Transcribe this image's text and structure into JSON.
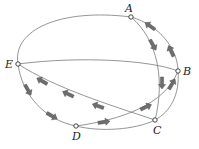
{
  "diagram": {
    "type": "directed-graph-tour",
    "nodes": [
      {
        "id": "A",
        "label": "A"
      },
      {
        "id": "B",
        "label": "B"
      },
      {
        "id": "C",
        "label": "C"
      },
      {
        "id": "D",
        "label": "D"
      },
      {
        "id": "E",
        "label": "E"
      }
    ],
    "edges": [
      {
        "from": "A",
        "to": "E",
        "directed": false
      },
      {
        "from": "E",
        "to": "B",
        "directed": false
      },
      {
        "from": "A",
        "to": "C",
        "directed": true,
        "arrow": "A-to-C"
      },
      {
        "from": "B",
        "to": "A",
        "directed": true,
        "arrow": "B-to-A"
      },
      {
        "from": "C",
        "to": "B",
        "directed": false
      },
      {
        "from": "D",
        "to": "B",
        "directed": true,
        "arrow": "D-to-B"
      },
      {
        "from": "C",
        "to": "E",
        "directed": true,
        "arrow": "C-to-E"
      },
      {
        "from": "E",
        "to": "D",
        "directed": true,
        "arrow": "E-to-D"
      },
      {
        "from": "D",
        "to": "C",
        "directed": false
      }
    ],
    "colors": {
      "edge": "#7a7a7a",
      "arrow": "#6e6e6e",
      "node_fill": "#ffffff",
      "node_stroke": "#333333"
    }
  }
}
